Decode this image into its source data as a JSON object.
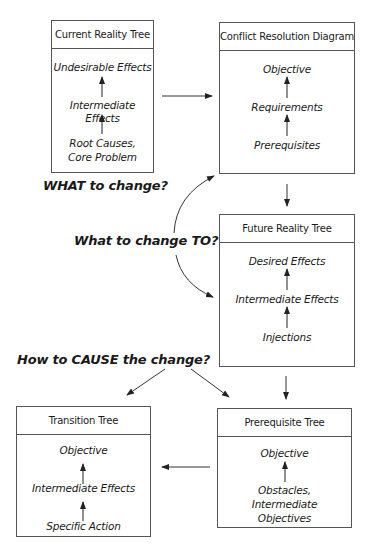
{
  "diagram": {
    "boxes": {
      "crt": {
        "title": "Current Reality Tree",
        "items": [
          "Undesirable Effects",
          "Intermediate Effects",
          "Root Causes,\nCore Problem"
        ]
      },
      "crd": {
        "title": "Conflict Resolution Diagram",
        "items": [
          "Objective",
          "Requirements",
          "Prerequisites"
        ]
      },
      "frt": {
        "title": "Future Reality Tree",
        "items": [
          "Desired Effects",
          "Intermediate Effects",
          "Injections"
        ]
      },
      "pt": {
        "title": "Prerequisite Tree",
        "items": [
          "Objective",
          "Obstacles,\nIntermediate\nObjectives"
        ]
      },
      "tt": {
        "title": "Transition Tree",
        "items": [
          "Objective",
          "Intermediate Effects",
          "Specific Action"
        ]
      }
    },
    "questions": {
      "what": "WHAT to change?",
      "to": "What to change TO?",
      "how": "How to CAUSE the change?"
    },
    "colors": {
      "line": "#333333",
      "box_border": "#555555",
      "text": "#1a1a1a"
    }
  }
}
